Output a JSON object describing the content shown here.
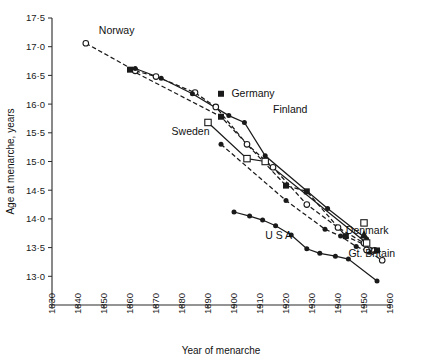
{
  "chart_data": {
    "type": "line",
    "title": "",
    "xlabel": "Year of menarche",
    "ylabel": "Age at menarche, years",
    "xlim": [
      1830,
      1960
    ],
    "ylim": [
      12.5,
      17.5
    ],
    "xticks": [
      "1830",
      "1840",
      "1850",
      "1860",
      "1870",
      "1880",
      "1890",
      "1900",
      "1910",
      "1920",
      "1930",
      "1940",
      "1950",
      "1960"
    ],
    "yticks": [
      "17·5",
      "17·0",
      "16·5",
      "16·0",
      "15·5",
      "15·0",
      "14·5",
      "14·0",
      "13·5",
      "13·0"
    ],
    "grid": false,
    "legend_position": "inline-annotations",
    "series": [
      {
        "name": "Norway",
        "label": "Norway",
        "label_x": 1848,
        "label_y": 17.28,
        "line": "dashed",
        "marker": "open-circle",
        "marker_override": {
          "0": "open-circle"
        },
        "points": [
          {
            "x": 1843,
            "y": 17.06
          },
          {
            "x": 1862,
            "y": 16.58
          },
          {
            "x": 1870,
            "y": 16.48
          },
          {
            "x": 1885,
            "y": 16.2
          },
          {
            "x": 1893,
            "y": 15.95
          },
          {
            "x": 1905,
            "y": 15.3
          },
          {
            "x": 1915,
            "y": 14.9
          },
          {
            "x": 1928,
            "y": 14.25
          },
          {
            "x": 1940,
            "y": 13.85
          },
          {
            "x": 1950,
            "y": 13.58
          },
          {
            "x": 1954,
            "y": 13.45
          }
        ]
      },
      {
        "name": "Germany",
        "label": "Germany",
        "label_x": 1899,
        "label_y": 16.18,
        "line": "dashed",
        "marker": "filled-square",
        "points": [
          {
            "x": 1860,
            "y": 16.6
          },
          {
            "x": 1895,
            "y": 15.78
          },
          {
            "x": 1920,
            "y": 14.58
          },
          {
            "x": 1928,
            "y": 14.48
          },
          {
            "x": 1943,
            "y": 13.7
          },
          {
            "x": 1955,
            "y": 13.45
          }
        ]
      },
      {
        "name": "Finland",
        "label": "Finland",
        "label_x": 1915,
        "label_y": 15.9,
        "line": "solid",
        "marker": "filled-circle",
        "points": [
          {
            "x": 1862,
            "y": 16.62
          },
          {
            "x": 1872,
            "y": 16.45
          },
          {
            "x": 1884,
            "y": 16.18
          },
          {
            "x": 1898,
            "y": 15.8
          },
          {
            "x": 1904,
            "y": 15.68
          },
          {
            "x": 1912,
            "y": 15.1
          },
          {
            "x": 1936,
            "y": 14.18
          },
          {
            "x": 1951,
            "y": 13.65
          }
        ]
      },
      {
        "name": "Sweden",
        "label": "Sweden",
        "label_x": 1876,
        "label_y": 15.52,
        "line": "solid",
        "marker": "open-square",
        "points": [
          {
            "x": 1890,
            "y": 15.68
          },
          {
            "x": 1905,
            "y": 15.05
          },
          {
            "x": 1912,
            "y": 15.0
          },
          {
            "x": 1951,
            "y": 13.58
          }
        ]
      },
      {
        "name": "USA",
        "label": "U S A",
        "label_x": 1912,
        "label_y": 13.72,
        "line": "solid",
        "marker": "filled-circle",
        "points": [
          {
            "x": 1900,
            "y": 14.12
          },
          {
            "x": 1906,
            "y": 14.05
          },
          {
            "x": 1911,
            "y": 13.98
          },
          {
            "x": 1916,
            "y": 13.88
          },
          {
            "x": 1922,
            "y": 13.72
          },
          {
            "x": 1928,
            "y": 13.48
          },
          {
            "x": 1933,
            "y": 13.4
          },
          {
            "x": 1939,
            "y": 13.35
          },
          {
            "x": 1944,
            "y": 13.3
          },
          {
            "x": 1955,
            "y": 12.92
          }
        ]
      },
      {
        "name": "Gt. Britain",
        "label": "Gt. Britain",
        "label_x": 1944,
        "label_y": 13.4,
        "line": "dashed",
        "marker": "filled-circle",
        "marker_final": "open-circle",
        "points": [
          {
            "x": 1895,
            "y": 15.3
          },
          {
            "x": 1920,
            "y": 14.32
          },
          {
            "x": 1935,
            "y": 13.82
          },
          {
            "x": 1941,
            "y": 13.7
          },
          {
            "x": 1947,
            "y": 13.52
          },
          {
            "x": 1952,
            "y": 13.42
          },
          {
            "x": 1957,
            "y": 13.28
          }
        ]
      },
      {
        "name": "Denmark",
        "label": "Denmark",
        "label_x": 1943,
        "label_y": 13.8,
        "line": "none",
        "marker": "filled-triangle",
        "points": [
          {
            "x": 1950,
            "y": 13.72
          }
        ]
      }
    ],
    "annotation_markers": [
      {
        "name": "germany-legend-swatch",
        "shape": "filled-square",
        "x": 1895,
        "y": 16.18
      },
      {
        "name": "denmark-open-square-point",
        "shape": "open-square",
        "x": 1950,
        "y": 13.93
      },
      {
        "name": "gtbritain-open-circle-point",
        "shape": "open-circle",
        "x": 1951,
        "y": 13.46
      }
    ]
  }
}
